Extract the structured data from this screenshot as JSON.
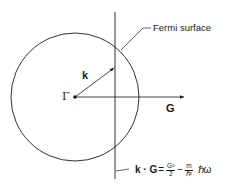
{
  "diagram": {
    "type": "fermi-surface-construction",
    "labels": {
      "fermi_surface": "Fermi surface",
      "k_vector": "k",
      "gamma_point": "Γ",
      "G_vector": "G"
    },
    "equation": {
      "lhs": "k · G",
      "equals": "=",
      "term1_num": "G²",
      "term1_den": "2",
      "minus": "−",
      "term2_num": "m",
      "term2_den": "ℏ²",
      "tail": "ℏω"
    },
    "colors": {
      "stroke": "#1a1a1a",
      "background": "#ffffff"
    }
  }
}
